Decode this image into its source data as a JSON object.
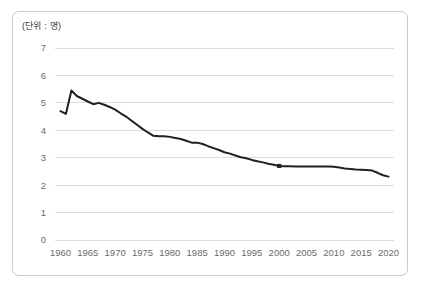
{
  "chart": {
    "unit_label": "(단위 : 명)",
    "line_color": "#231f20",
    "grid_color": "#dcdcdc",
    "border_color": "#c9c9c9",
    "tick_color": "#6b6b6b"
  },
  "chart_data": {
    "type": "line",
    "title": "",
    "subtitle": "",
    "xlabel": "",
    "ylabel": "",
    "unit_note": "(단위 : 명)",
    "grid": "horizontal",
    "legend": "none",
    "xlim": [
      1959,
      2021
    ],
    "ylim": [
      0,
      7
    ],
    "yticks": [
      0,
      1,
      2,
      3,
      4,
      5,
      6,
      7
    ],
    "ytick_labels": [
      "0",
      "1",
      "2",
      "3",
      "4",
      "5",
      "6",
      "7"
    ],
    "xticks": [
      1960,
      1965,
      1970,
      1975,
      1980,
      1985,
      1990,
      1995,
      2000,
      2005,
      2010,
      2015,
      2020
    ],
    "xtick_labels": [
      "1960",
      "1965",
      "1970",
      "1975",
      "1980",
      "1985",
      "1990",
      "1995",
      "2000",
      "2005",
      "2010",
      "2015",
      "2020"
    ],
    "markers": [
      {
        "x": 2000,
        "y": 2.7
      }
    ],
    "series": [
      {
        "name": "평균 가구원 수",
        "x": [
          1960,
          1961,
          1962,
          1963,
          1964,
          1965,
          1966,
          1967,
          1968,
          1969,
          1970,
          1971,
          1972,
          1973,
          1974,
          1975,
          1976,
          1977,
          1978,
          1979,
          1980,
          1981,
          1982,
          1983,
          1984,
          1985,
          1986,
          1987,
          1988,
          1989,
          1990,
          1991,
          1992,
          1993,
          1994,
          1995,
          1996,
          1997,
          1998,
          1999,
          2000,
          2001,
          2002,
          2003,
          2004,
          2005,
          2006,
          2007,
          2008,
          2009,
          2010,
          2011,
          2012,
          2013,
          2014,
          2015,
          2016,
          2017,
          2018,
          2019,
          2020
        ],
        "y": [
          4.7,
          4.6,
          5.45,
          5.25,
          5.15,
          5.05,
          4.95,
          5.0,
          4.93,
          4.85,
          4.75,
          4.62,
          4.5,
          4.35,
          4.2,
          4.05,
          3.92,
          3.8,
          3.78,
          3.78,
          3.76,
          3.72,
          3.68,
          3.62,
          3.55,
          3.55,
          3.5,
          3.42,
          3.35,
          3.28,
          3.2,
          3.15,
          3.08,
          3.02,
          2.98,
          2.92,
          2.87,
          2.83,
          2.78,
          2.74,
          2.7,
          2.69,
          2.69,
          2.68,
          2.68,
          2.68,
          2.68,
          2.68,
          2.68,
          2.68,
          2.67,
          2.64,
          2.61,
          2.59,
          2.57,
          2.56,
          2.55,
          2.53,
          2.45,
          2.36,
          2.31
        ]
      }
    ]
  }
}
